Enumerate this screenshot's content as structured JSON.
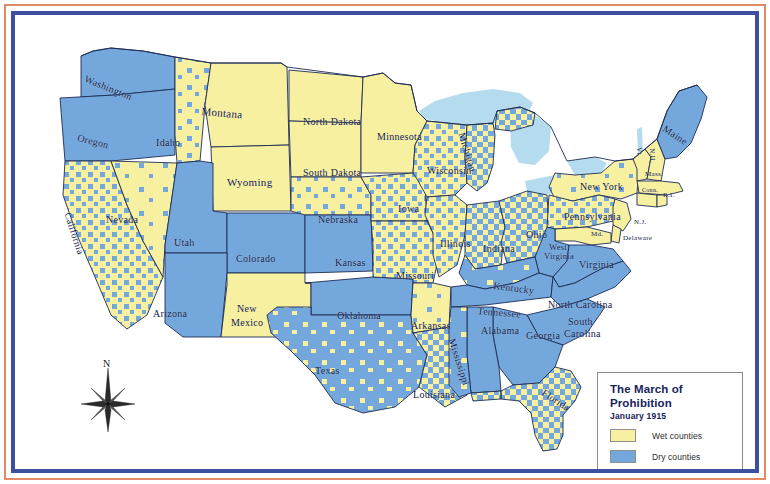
{
  "map": {
    "title": "The March of Prohibition",
    "subtitle": "January 1915",
    "compass_north_label": "N",
    "colors": {
      "wet": "#f6f0a0",
      "dry": "#74a8dc",
      "lake": "#b5dcee",
      "border_outer": "#e08a66",
      "border_inner": "#3f4fa0",
      "state_line": "#1d2b55",
      "background": "#ffffff"
    },
    "legend": {
      "items": [
        {
          "label": "Wet counties",
          "color": "#f6f0a0",
          "swatch_name": "wet-counties-swatch"
        },
        {
          "label": "Dry counties",
          "color": "#74a8dc",
          "swatch_name": "dry-counties-swatch"
        }
      ]
    },
    "states": [
      {
        "name": "Washington",
        "x": 72,
        "y": 58,
        "rot": 22,
        "size": "s-md"
      },
      {
        "name": "Oregon",
        "x": 64,
        "y": 117,
        "rot": 14,
        "size": "s-md"
      },
      {
        "name": "Idaho",
        "x": 141,
        "y": 122,
        "rot": 0,
        "size": "s-md"
      },
      {
        "name": "Montana",
        "x": 187,
        "y": 90,
        "rot": 5,
        "size": "s-lg"
      },
      {
        "name": "Wyoming",
        "x": 212,
        "y": 161,
        "rot": 0,
        "size": "s-lg"
      },
      {
        "name": "Nevada",
        "x": 91,
        "y": 199,
        "rot": 0,
        "size": "s-md"
      },
      {
        "name": "California",
        "x": 58,
        "y": 196,
        "rot": 72,
        "size": "s-md"
      },
      {
        "name": "Utah",
        "x": 159,
        "y": 222,
        "rot": 0,
        "size": "s-md"
      },
      {
        "name": "Colorado",
        "x": 221,
        "y": 238,
        "rot": 0,
        "size": "s-md"
      },
      {
        "name": "Arizona",
        "x": 138,
        "y": 293,
        "rot": 0,
        "size": "s-md"
      },
      {
        "name": "New",
        "x": 222,
        "y": 288,
        "rot": 0,
        "size": "s-md"
      },
      {
        "name": "Mexico",
        "x": 216,
        "y": 302,
        "rot": 0,
        "size": "s-md"
      },
      {
        "name": "North Dakota",
        "x": 288,
        "y": 101,
        "rot": 0,
        "size": "s-md"
      },
      {
        "name": "South Dakota",
        "x": 288,
        "y": 152,
        "rot": 0,
        "size": "s-md"
      },
      {
        "name": "Nebraska",
        "x": 303,
        "y": 199,
        "rot": 0,
        "size": "s-md"
      },
      {
        "name": "Kansas",
        "x": 320,
        "y": 242,
        "rot": 0,
        "size": "s-md"
      },
      {
        "name": "Oklahoma",
        "x": 322,
        "y": 295,
        "rot": 0,
        "size": "s-md"
      },
      {
        "name": "Texas",
        "x": 300,
        "y": 350,
        "rot": 0,
        "size": "s-md"
      },
      {
        "name": "Minnesota",
        "x": 362,
        "y": 116,
        "rot": 0,
        "size": "s-md"
      },
      {
        "name": "Iowa",
        "x": 383,
        "y": 188,
        "rot": 0,
        "size": "s-md"
      },
      {
        "name": "Missouri",
        "x": 381,
        "y": 255,
        "rot": 0,
        "size": "s-md"
      },
      {
        "name": "Arkansas",
        "x": 396,
        "y": 305,
        "rot": 0,
        "size": "s-md"
      },
      {
        "name": "Louisiana",
        "x": 398,
        "y": 374,
        "rot": 0,
        "size": "s-md"
      },
      {
        "name": "Wisconsin",
        "x": 412,
        "y": 150,
        "rot": 0,
        "size": "s-md"
      },
      {
        "name": "Illinois",
        "x": 425,
        "y": 223,
        "rot": 0,
        "size": "s-md"
      },
      {
        "name": "Michigan",
        "x": 452,
        "y": 116,
        "rot": 73,
        "size": "s-md"
      },
      {
        "name": "Mississippi",
        "x": 442,
        "y": 322,
        "rot": 72,
        "size": "s-md"
      },
      {
        "name": "Indiana",
        "x": 468,
        "y": 228,
        "rot": 0,
        "size": "s-md"
      },
      {
        "name": "Alabama",
        "x": 466,
        "y": 310,
        "rot": 0,
        "size": "s-md"
      },
      {
        "name": "Ohio",
        "x": 511,
        "y": 214,
        "rot": 0,
        "size": "s-md"
      },
      {
        "name": "Kentucky",
        "x": 479,
        "y": 265,
        "rot": 7,
        "size": "s-md"
      },
      {
        "name": "Tennessee",
        "x": 463,
        "y": 290,
        "rot": 5,
        "size": "s-md"
      },
      {
        "name": "Georgia",
        "x": 511,
        "y": 315,
        "rot": 0,
        "size": "s-md"
      },
      {
        "name": "West",
        "x": 534,
        "y": 227,
        "rot": 0,
        "size": "s-sm"
      },
      {
        "name": "Virginia",
        "x": 529,
        "y": 236,
        "rot": 0,
        "size": "s-sm"
      },
      {
        "name": "Virginia",
        "x": 564,
        "y": 244,
        "rot": 0,
        "size": "s-md"
      },
      {
        "name": "North Carolina",
        "x": 533,
        "y": 284,
        "rot": 0,
        "size": "s-md"
      },
      {
        "name": "South",
        "x": 553,
        "y": 301,
        "rot": 0,
        "size": "s-md"
      },
      {
        "name": "Carolina",
        "x": 549,
        "y": 313,
        "rot": 0,
        "size": "s-md"
      },
      {
        "name": "Florida",
        "x": 531,
        "y": 372,
        "rot": 33,
        "size": "s-md"
      },
      {
        "name": "New York",
        "x": 565,
        "y": 166,
        "rot": 0,
        "size": "s-md"
      },
      {
        "name": "Pennsylvania",
        "x": 549,
        "y": 196,
        "rot": 0,
        "size": "s-md"
      },
      {
        "name": "Maine",
        "x": 652,
        "y": 108,
        "rot": 33,
        "size": "s-md"
      },
      {
        "name": "Vt.",
        "x": 628,
        "y": 132,
        "rot": 88,
        "size": "s-xs"
      },
      {
        "name": "N.H.",
        "x": 641,
        "y": 133,
        "rot": 88,
        "size": "s-xs"
      },
      {
        "name": "Mass.",
        "x": 630,
        "y": 155,
        "rot": 0,
        "size": "s-xs"
      },
      {
        "name": "Conn.",
        "x": 627,
        "y": 172,
        "rot": 0,
        "size": "s-xxs"
      },
      {
        "name": "R.I.",
        "x": 648,
        "y": 176,
        "rot": 0,
        "size": "s-xs"
      },
      {
        "name": "N.J.",
        "x": 619,
        "y": 203,
        "rot": 0,
        "size": "s-xs"
      },
      {
        "name": "Md.",
        "x": 576,
        "y": 215,
        "rot": 0,
        "size": "s-xs"
      },
      {
        "name": "Delaware",
        "x": 608,
        "y": 219,
        "rot": 0,
        "size": "s-xs"
      }
    ]
  }
}
